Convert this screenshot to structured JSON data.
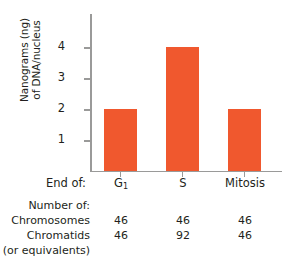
{
  "chart_data": {
    "type": "bar",
    "title": "",
    "xlabel": "End of:",
    "ylabel": "Nanograms (ng) of DNA/nucleus",
    "ylabel_line1": "Nanograms (ng)",
    "ylabel_line2": "of DNA/nucleus",
    "categories": [
      "G₁",
      "S",
      "Mitosis"
    ],
    "values": [
      2,
      4,
      2
    ],
    "ylim": [
      0,
      4.6
    ],
    "yticks": [
      1,
      2,
      3,
      4
    ],
    "ytick_labels": [
      "1",
      "2",
      "3",
      "4"
    ],
    "grid": false,
    "legend": null,
    "bar_color": "#f0582e",
    "axis_color": "#9a9a99",
    "text_color": "#231f20"
  },
  "axis": {
    "y_labels": [
      "4",
      "3",
      "2",
      "1"
    ],
    "y_title_line1": "Nanograms (ng)",
    "y_title_line2": "of DNA/nucleus"
  },
  "category_row": {
    "label": "End of:",
    "cells": [
      {
        "base": "G",
        "sub": "1"
      },
      {
        "base": "S",
        "sub": ""
      },
      {
        "base": "Mitosis",
        "sub": ""
      }
    ]
  },
  "table": {
    "header": "Number of:",
    "rows": [
      {
        "label": "Chromosomes",
        "values": [
          "46",
          "46",
          "46"
        ]
      },
      {
        "label": "Chromatids",
        "values": [
          "46",
          "92",
          "46"
        ]
      }
    ],
    "footnote": "(or equivalents)"
  }
}
